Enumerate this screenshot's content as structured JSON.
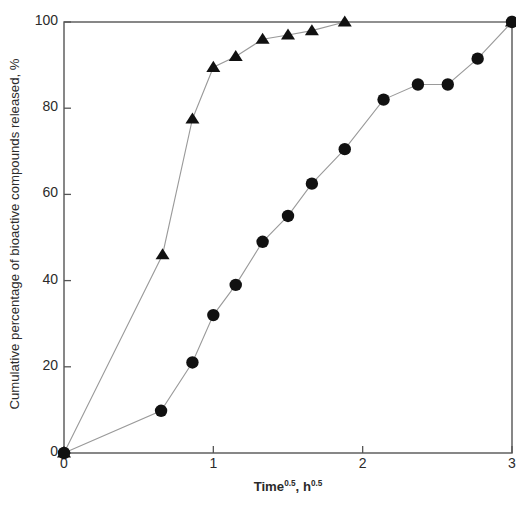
{
  "chart_data": {
    "type": "line",
    "title": "",
    "xlabel": "Time0.5, h0.5",
    "xlabel_base": "Time",
    "xlabel_exp1": "0.5",
    "xlabel_mid": ", h",
    "xlabel_exp2": "0.5",
    "ylabel": "Cumulative percentage of bioactive compounds released, %",
    "xlim": [
      0,
      3
    ],
    "ylim": [
      0,
      100
    ],
    "xticks": [
      0,
      1,
      2,
      3
    ],
    "xtick_labels": [
      "0",
      "1",
      "2",
      "3"
    ],
    "yticks": [
      0,
      20,
      40,
      60,
      80,
      100
    ],
    "ytick_labels": [
      "0",
      "20",
      "40",
      "60",
      "80",
      "100"
    ],
    "grid": false,
    "legend": "none",
    "frame": "box",
    "series": [
      {
        "name": "triangle-series",
        "marker": "triangle",
        "color": "#111111",
        "linestyle": "solid-thin",
        "x": [
          0,
          0.66,
          0.86,
          1.0,
          1.15,
          1.33,
          1.5,
          1.66,
          1.88,
          3.0
        ],
        "values": [
          0,
          46,
          77.5,
          89.5,
          92,
          96,
          97,
          98,
          100,
          100
        ]
      },
      {
        "name": "circle-series",
        "marker": "circle",
        "color": "#111111",
        "linestyle": "solid-thin",
        "x": [
          0,
          0.65,
          0.86,
          1.0,
          1.15,
          1.33,
          1.5,
          1.66,
          1.88,
          2.14,
          2.37,
          2.57,
          2.77,
          3.0
        ],
        "values": [
          0,
          9.8,
          21,
          32,
          39,
          49,
          55,
          62.5,
          70.5,
          82,
          85.5,
          85.5,
          91.5,
          100
        ]
      }
    ]
  },
  "figure": {
    "background": "#ffffff",
    "axis_color": "#555555",
    "text_color": "#2b2b2b"
  }
}
